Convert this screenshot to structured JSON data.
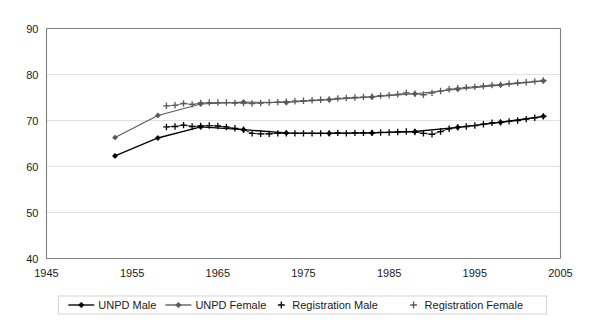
{
  "chart_data": {
    "type": "line",
    "title": "",
    "xlabel": "",
    "ylabel": "",
    "xlim": [
      1945,
      2005
    ],
    "ylim": [
      40,
      90
    ],
    "xticks": [
      "1945",
      "1955",
      "1965",
      "1975",
      "1985",
      "1995",
      "2005"
    ],
    "yticks": [
      "40",
      "50",
      "60",
      "70",
      "80",
      "90"
    ],
    "grid": "horizontal",
    "legend_position": "bottom",
    "series": [
      {
        "name": "UNPD Male",
        "marker": "diamond",
        "color": "#000000",
        "x": [
          1953,
          1958,
          1963,
          1968,
          1973,
          1978,
          1983,
          1988,
          1993,
          1998,
          2003
        ],
        "values": [
          62.3,
          66.2,
          68.6,
          68.0,
          67.3,
          67.2,
          67.3,
          67.6,
          68.5,
          69.6,
          70.9
        ]
      },
      {
        "name": "UNPD Female",
        "marker": "diamond",
        "color": "#595959",
        "x": [
          1953,
          1958,
          1963,
          1968,
          1973,
          1978,
          1983,
          1988,
          1993,
          1998,
          2003
        ],
        "values": [
          66.3,
          71.1,
          73.6,
          74.0,
          73.9,
          74.5,
          75.1,
          75.8,
          76.8,
          77.7,
          78.6
        ]
      },
      {
        "name": "Registration Male",
        "marker": "plus",
        "color": "#000000",
        "x": [
          1959,
          1960,
          1961,
          1962,
          1963,
          1964,
          1965,
          1966,
          1967,
          1968,
          1969,
          1970,
          1971,
          1972,
          1973,
          1974,
          1975,
          1976,
          1977,
          1978,
          1979,
          1980,
          1981,
          1982,
          1983,
          1984,
          1985,
          1986,
          1987,
          1988,
          1989,
          1990,
          1991,
          1992,
          1993,
          1994,
          1995,
          1996,
          1997,
          1998,
          1999,
          2000,
          2001,
          2002,
          2003
        ],
        "values": [
          68.6,
          68.7,
          69.0,
          68.7,
          68.8,
          68.9,
          68.8,
          68.6,
          68.3,
          68.0,
          67.2,
          67.1,
          67.1,
          67.2,
          67.2,
          67.2,
          67.2,
          67.2,
          67.2,
          67.2,
          67.3,
          67.2,
          67.3,
          67.3,
          67.3,
          67.4,
          67.4,
          67.5,
          67.6,
          67.5,
          67.2,
          67.0,
          67.6,
          68.2,
          68.5,
          68.7,
          68.9,
          69.2,
          69.5,
          69.6,
          69.8,
          70.0,
          70.3,
          70.6,
          70.9
        ]
      },
      {
        "name": "Registration Female",
        "marker": "plus",
        "color": "#595959",
        "x": [
          1959,
          1960,
          1961,
          1962,
          1963,
          1964,
          1965,
          1966,
          1967,
          1968,
          1969,
          1970,
          1971,
          1972,
          1973,
          1974,
          1975,
          1976,
          1977,
          1978,
          1979,
          1980,
          1981,
          1982,
          1983,
          1984,
          1985,
          1986,
          1987,
          1988,
          1989,
          1990,
          1991,
          1992,
          1993,
          1994,
          1995,
          1996,
          1997,
          1998,
          1999,
          2000,
          2001,
          2002,
          2003
        ],
        "values": [
          73.2,
          73.3,
          73.7,
          73.5,
          73.8,
          73.9,
          73.9,
          73.9,
          73.8,
          73.8,
          73.7,
          73.8,
          73.9,
          74.0,
          74.1,
          74.2,
          74.3,
          74.4,
          74.5,
          74.6,
          74.8,
          74.9,
          75.0,
          75.1,
          75.2,
          75.4,
          75.5,
          75.7,
          76.0,
          75.8,
          75.6,
          76.0,
          76.4,
          76.8,
          77.0,
          77.2,
          77.3,
          77.5,
          77.7,
          77.8,
          78.0,
          78.2,
          78.3,
          78.5,
          78.7
        ]
      }
    ]
  },
  "legend": {
    "items": [
      {
        "label": "UNPD Male",
        "marker": "line-diamond",
        "color": "#000000"
      },
      {
        "label": "UNPD Female",
        "marker": "line-diamond",
        "color": "#595959"
      },
      {
        "label": "Registration Male",
        "marker": "plus",
        "color": "#000000"
      },
      {
        "label": "Registration Female",
        "marker": "plus",
        "color": "#595959"
      }
    ]
  }
}
